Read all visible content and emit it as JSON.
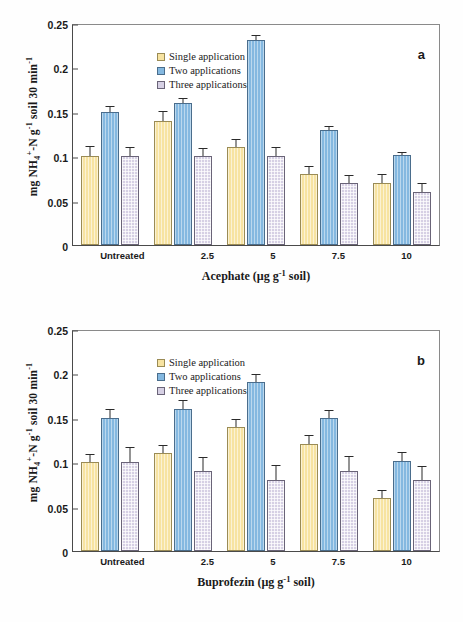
{
  "figure": {
    "background_color": "#ffffff",
    "series_colors": {
      "single": "#f7e3a1",
      "two": "#84b8e0",
      "three": "#d6d0e4"
    }
  },
  "panels": [
    {
      "label": "a"
    },
    {
      "label": "b"
    }
  ],
  "axis": {
    "y_title_prefix": "mg NH",
    "y_title_sub": "4",
    "y_title_sup_plus": "+",
    "y_title_mid": "-N g",
    "y_title_sup_neg1": "-1",
    "y_title_suffix": " soil 30 min",
    "y_title_sup_neg1b": "-1",
    "y_title_full": "mg NH4+-N g-1 soil 30 min-1",
    "y_ticks": [
      "0",
      "0.05",
      "0.1",
      "0.15",
      "0.2",
      "0.25"
    ]
  },
  "legend": {
    "items": [
      {
        "label": "Single application",
        "key": "single"
      },
      {
        "label": "Two applications",
        "key": "two"
      },
      {
        "label": "Three applications",
        "key": "three"
      }
    ]
  },
  "chart_data": [
    {
      "type": "bar",
      "panel": "a",
      "title": "",
      "xlabel": "Acephate (µg g-1 soil)",
      "xlabel_main": "Acephate (µg g",
      "xlabel_sup": "-1",
      "xlabel_tail": " soil)",
      "ylabel": "mg NH4+-N g-1 soil 30 min-1",
      "ylim": [
        0,
        0.25
      ],
      "ytick_values": [
        0,
        0.05,
        0.1,
        0.15,
        0.2,
        0.25
      ],
      "grid": false,
      "legend_position": "top-left",
      "categories": [
        "Untreated",
        "2.5",
        "5",
        "7.5",
        "10"
      ],
      "series": [
        {
          "name": "Single application",
          "values": [
            0.1,
            0.14,
            0.11,
            0.08,
            0.07
          ],
          "errors": [
            0.01,
            0.01,
            0.008,
            0.008,
            0.009
          ]
        },
        {
          "name": "Two applications",
          "values": [
            0.15,
            0.16,
            0.231,
            0.13,
            0.101
          ],
          "errors": [
            0.005,
            0.004,
            0.004,
            0.003,
            0.003
          ]
        },
        {
          "name": "Three applications",
          "values": [
            0.1,
            0.1,
            0.1,
            0.07,
            0.06
          ],
          "errors": [
            0.009,
            0.008,
            0.009,
            0.008,
            0.009
          ]
        }
      ]
    },
    {
      "type": "bar",
      "panel": "b",
      "title": "",
      "xlabel": "Buprofezin (µg g-1 soil)",
      "xlabel_main": "Buprofezin (µg g",
      "xlabel_sup": "-1",
      "xlabel_tail": " soil)",
      "ylabel": "mg NH4+-N g-1 soil 30 min-1",
      "ylim": [
        0,
        0.25
      ],
      "ytick_values": [
        0,
        0.05,
        0.1,
        0.15,
        0.2,
        0.25
      ],
      "grid": false,
      "legend_position": "top-left",
      "categories": [
        "Untreated",
        "2.5",
        "5",
        "7.5",
        "10"
      ],
      "series": [
        {
          "name": "Single application",
          "values": [
            0.1,
            0.11,
            0.14,
            0.12,
            0.06
          ],
          "errors": [
            0.008,
            0.008,
            0.008,
            0.009,
            0.008
          ]
        },
        {
          "name": "Two applications",
          "values": [
            0.15,
            0.16,
            0.19,
            0.15,
            0.101
          ],
          "errors": [
            0.009,
            0.009,
            0.008,
            0.008,
            0.009
          ]
        },
        {
          "name": "Three applications",
          "values": [
            0.1,
            0.09,
            0.08,
            0.09,
            0.08
          ],
          "errors": [
            0.016,
            0.015,
            0.016,
            0.016,
            0.015
          ]
        }
      ]
    }
  ]
}
